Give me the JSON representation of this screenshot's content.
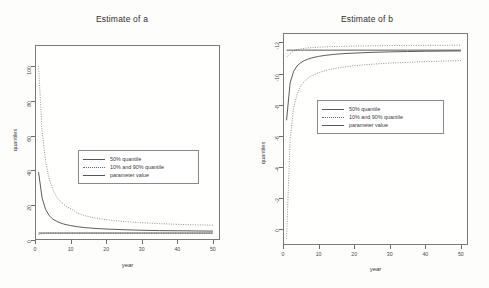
{
  "figure": {
    "panels": [
      {
        "key": "panel_a",
        "title": "Estimate of a",
        "xlabel": "year",
        "ylabel": "quantiles",
        "xticks": [
          "0",
          "10",
          "20",
          "30",
          "40",
          "50"
        ],
        "yticks": [
          "100",
          "80",
          "60",
          "40",
          "20",
          "0"
        ]
      },
      {
        "key": "panel_b",
        "title": "Estimate of b",
        "xlabel": "year",
        "ylabel": "quantiles",
        "xticks": [
          "0",
          "10",
          "20",
          "30",
          "40",
          "50"
        ],
        "yticks": [
          "0",
          "-2",
          "-4",
          "-6",
          "-8",
          "-10",
          "-12"
        ]
      }
    ],
    "legend": {
      "items": [
        {
          "label": "50% quantile",
          "style": "solid"
        },
        {
          "label": "10% and 90% quantile",
          "style": "dotted"
        },
        {
          "label": "parameter value",
          "style": "solid"
        }
      ]
    }
  },
  "chart_data": [
    {
      "type": "line",
      "title": "Estimate of a",
      "xlabel": "year",
      "ylabel": "quantiles",
      "xlim": [
        0,
        52
      ],
      "ylim": [
        0,
        112
      ],
      "xticks": [
        0,
        10,
        20,
        30,
        40,
        50
      ],
      "yticks": [
        0,
        20,
        40,
        60,
        80,
        100
      ],
      "grid": false,
      "legend_position": "center",
      "x": [
        1,
        2,
        3,
        4,
        5,
        6,
        7,
        8,
        9,
        10,
        12,
        14,
        16,
        18,
        20,
        25,
        30,
        35,
        40,
        45,
        50
      ],
      "series": [
        {
          "name": "90% quantile",
          "style": "dotted",
          "values": [
            100,
            62,
            45,
            35,
            29,
            25,
            22.5,
            20.5,
            19,
            18,
            15.5,
            14,
            13,
            12.3,
            11.7,
            10.6,
            9.9,
            9.4,
            9.0,
            8.7,
            8.5
          ]
        },
        {
          "name": "50% quantile",
          "style": "solid",
          "values": [
            39,
            24,
            17.5,
            14,
            12,
            10.8,
            9.9,
            9.2,
            8.7,
            8.3,
            7.6,
            7.1,
            6.8,
            6.5,
            6.3,
            5.9,
            5.6,
            5.4,
            5.3,
            5.2,
            5.1
          ]
        },
        {
          "name": "10% quantile",
          "style": "dotted",
          "values": [
            3.0,
            3.6,
            3.8,
            3.9,
            3.9,
            3.9,
            3.9,
            3.9,
            3.9,
            3.9,
            3.9,
            3.9,
            3.9,
            3.9,
            3.9,
            3.9,
            3.9,
            3.9,
            3.9,
            3.9,
            3.9
          ]
        },
        {
          "name": "parameter value",
          "style": "solid",
          "constant": 4.0,
          "values": [
            4,
            4,
            4,
            4,
            4,
            4,
            4,
            4,
            4,
            4,
            4,
            4,
            4,
            4,
            4,
            4,
            4,
            4,
            4,
            4,
            4
          ]
        }
      ]
    },
    {
      "type": "line",
      "title": "Estimate of b",
      "xlabel": "year",
      "ylabel": "quantiles",
      "xlim": [
        0,
        52
      ],
      "ylim": [
        -13,
        0.6
      ],
      "xticks": [
        0,
        10,
        20,
        30,
        40,
        50
      ],
      "yticks": [
        0,
        -2,
        -4,
        -6,
        -8,
        -10,
        -12
      ],
      "grid": false,
      "legend_position": "center",
      "x": [
        1,
        2,
        3,
        4,
        5,
        6,
        7,
        8,
        9,
        10,
        12,
        14,
        16,
        18,
        20,
        25,
        30,
        35,
        40,
        45,
        50
      ],
      "series": [
        {
          "name": "90% quantile",
          "style": "dotted",
          "values": [
            -0.95,
            -0.72,
            -0.55,
            -0.47,
            -0.42,
            -0.39,
            -0.36,
            -0.34,
            -0.32,
            -0.31,
            -0.29,
            -0.27,
            -0.26,
            -0.25,
            -0.24,
            -0.22,
            -0.21,
            -0.2,
            -0.19,
            -0.19,
            -0.18
          ]
        },
        {
          "name": "50% quantile",
          "style": "solid",
          "values": [
            -5.0,
            -2.6,
            -1.85,
            -1.5,
            -1.3,
            -1.17,
            -1.08,
            -1.0,
            -0.95,
            -0.9,
            -0.83,
            -0.78,
            -0.74,
            -0.71,
            -0.69,
            -0.64,
            -0.61,
            -0.59,
            -0.57,
            -0.56,
            -0.55
          ]
        },
        {
          "name": "10% quantile",
          "style": "dotted",
          "values": [
            -12.6,
            -6.2,
            -4.2,
            -3.3,
            -2.8,
            -2.5,
            -2.3,
            -2.15,
            -2.05,
            -1.95,
            -1.8,
            -1.7,
            -1.62,
            -1.56,
            -1.5,
            -1.4,
            -1.33,
            -1.28,
            -1.24,
            -1.2,
            -1.17
          ]
        },
        {
          "name": "parameter value",
          "style": "solid",
          "constant": -0.5,
          "values": [
            -0.5,
            -0.5,
            -0.5,
            -0.5,
            -0.5,
            -0.5,
            -0.5,
            -0.5,
            -0.5,
            -0.5,
            -0.5,
            -0.5,
            -0.5,
            -0.5,
            -0.5,
            -0.5,
            -0.5,
            -0.5,
            -0.5,
            -0.5,
            -0.5
          ]
        }
      ]
    }
  ]
}
